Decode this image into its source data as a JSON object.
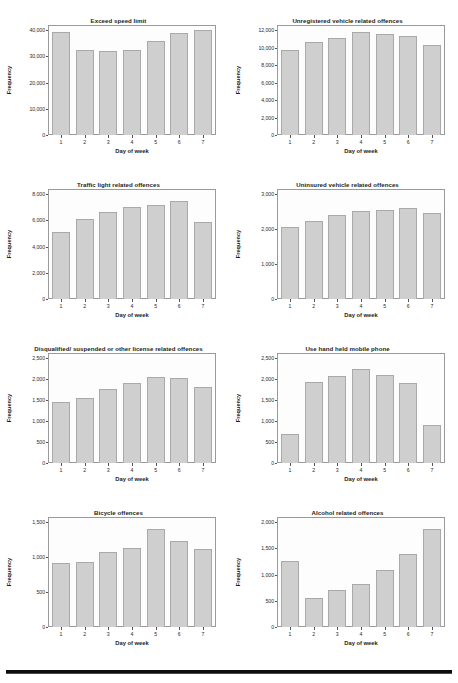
{
  "document": {
    "axis_label_x": "Day of week",
    "axis_label_y": "Frequency",
    "categories": [
      "1",
      "2",
      "3",
      "4",
      "5",
      "6",
      "7"
    ],
    "bar_color": "#cfcfcf",
    "bar_border_color": "#a9a9a9",
    "frame_color": "#9a9a9a",
    "rule_color": "#0d0d0d"
  },
  "chart_data": [
    {
      "type": "bar",
      "title": "Exceed speed limit",
      "xlabel": "Day of week",
      "ylabel": "Frequency",
      "categories": [
        "1",
        "2",
        "3",
        "4",
        "5",
        "6",
        "7"
      ],
      "values": [
        39300,
        32400,
        32200,
        32600,
        36000,
        38900,
        40000
      ],
      "ylim": [
        0,
        42000
      ],
      "yticks": [
        0,
        10000,
        20000,
        30000,
        40000
      ],
      "ytick_labels": [
        "0",
        "10,000",
        "20,000",
        "30,000",
        "40,000"
      ],
      "grid": false,
      "legend": "none"
    },
    {
      "type": "bar",
      "title": "Unregistered vehicle related offences",
      "xlabel": "Day of week",
      "ylabel": "Frequency",
      "categories": [
        "1",
        "2",
        "3",
        "4",
        "5",
        "6",
        "7"
      ],
      "values": [
        9750,
        10650,
        11150,
        11800,
        11550,
        11300,
        10350
      ],
      "ylim": [
        0,
        12600
      ],
      "yticks": [
        0,
        2000,
        4000,
        6000,
        8000,
        10000,
        12000
      ],
      "ytick_labels": [
        "0",
        "2,000",
        "4,000",
        "6,000",
        "8,000",
        "10,000",
        "12,000"
      ],
      "grid": false,
      "legend": "none"
    },
    {
      "type": "bar",
      "title": "Traffic light related offences",
      "xlabel": "Day of week",
      "ylabel": "Frequency",
      "categories": [
        "1",
        "2",
        "3",
        "4",
        "5",
        "6",
        "7"
      ],
      "values": [
        5100,
        6100,
        6650,
        7000,
        7200,
        7500,
        5900
      ],
      "ylim": [
        0,
        8400
      ],
      "yticks": [
        0,
        2000,
        4000,
        6000,
        8000
      ],
      "ytick_labels": [
        "0",
        "2,000",
        "4,000",
        "6,000",
        "8,000"
      ],
      "grid": false,
      "legend": "none"
    },
    {
      "type": "bar",
      "title": "Uninsured vehicle related offences",
      "xlabel": "Day of week",
      "ylabel": "Frequency",
      "categories": [
        "1",
        "2",
        "3",
        "4",
        "5",
        "6",
        "7"
      ],
      "values": [
        2060,
        2230,
        2420,
        2510,
        2540,
        2610,
        2450
      ],
      "ylim": [
        0,
        3150
      ],
      "yticks": [
        0,
        1000,
        2000,
        3000
      ],
      "ytick_labels": [
        "0",
        "1,000",
        "2,000",
        "3,000"
      ],
      "grid": false,
      "legend": "none"
    },
    {
      "type": "bar",
      "title": "Disqualified/ suspended or other license related offences",
      "xlabel": "Day of week",
      "ylabel": "Frequency",
      "categories": [
        "1",
        "2",
        "3",
        "4",
        "5",
        "6",
        "7"
      ],
      "values": [
        1460,
        1560,
        1760,
        1900,
        2060,
        2020,
        1810
      ],
      "ylim": [
        0,
        2625
      ],
      "yticks": [
        0,
        500,
        1000,
        1500,
        2000,
        2500
      ],
      "ytick_labels": [
        "0",
        "500",
        "1,000",
        "1,500",
        "2,000",
        "2,500"
      ],
      "grid": false,
      "legend": "none"
    },
    {
      "type": "bar",
      "title": "Use hand held mobile phone",
      "xlabel": "Day of week",
      "ylabel": "Frequency",
      "categories": [
        "1",
        "2",
        "3",
        "4",
        "5",
        "6",
        "7"
      ],
      "values": [
        690,
        1930,
        2070,
        2250,
        2100,
        1900,
        910
      ],
      "ylim": [
        0,
        2625
      ],
      "yticks": [
        0,
        500,
        1000,
        1500,
        2000,
        2500
      ],
      "ytick_labels": [
        "0",
        "500",
        "1,000",
        "1,500",
        "2,000",
        "2,500"
      ],
      "grid": false,
      "legend": "none"
    },
    {
      "type": "bar",
      "title": "Bicycle offences",
      "xlabel": "Day of week",
      "ylabel": "Frequency",
      "categories": [
        "1",
        "2",
        "3",
        "4",
        "5",
        "6",
        "7"
      ],
      "values": [
        920,
        930,
        1080,
        1130,
        1400,
        1230,
        1120
      ],
      "ylim": [
        0,
        1575
      ],
      "yticks": [
        0,
        500,
        1000,
        1500
      ],
      "ytick_labels": [
        "0",
        "500",
        "1,000",
        "1,500"
      ],
      "grid": false,
      "legend": "none"
    },
    {
      "type": "bar",
      "title": "Alcohol related offences",
      "xlabel": "Day of week",
      "ylabel": "Frequency",
      "categories": [
        "1",
        "2",
        "3",
        "4",
        "5",
        "6",
        "7"
      ],
      "values": [
        1260,
        560,
        700,
        820,
        1080,
        1400,
        1870
      ],
      "ylim": [
        0,
        2100
      ],
      "yticks": [
        0,
        500,
        1000,
        1500,
        2000
      ],
      "ytick_labels": [
        "0",
        "500",
        "1,000",
        "1,500",
        "2,000"
      ],
      "grid": false,
      "legend": "none"
    }
  ]
}
